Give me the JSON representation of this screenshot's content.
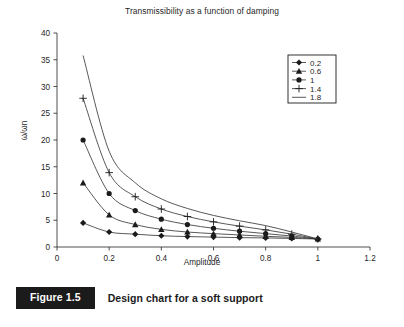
{
  "figure": {
    "caption_badge": "Figure 1.5",
    "caption_text": "Design chart for a soft support"
  },
  "chart_data": {
    "type": "line",
    "title": "Transmissibility as a function of damping",
    "xlabel": "Amplitude",
    "ylabel": "ω/ωn",
    "xlim": [
      0,
      1.2
    ],
    "ylim": [
      0,
      40
    ],
    "xticks": [
      0,
      0.2,
      0.4,
      0.6,
      0.8,
      1,
      1.2
    ],
    "xtick_labels": [
      "0",
      "0.2",
      "0.4",
      "0.6",
      "0.8",
      "1",
      "1.2"
    ],
    "yticks": [
      0,
      5,
      10,
      15,
      20,
      25,
      30,
      35,
      40
    ],
    "ytick_labels": [
      "0",
      "5",
      "10",
      "15",
      "20",
      "25",
      "30",
      "35",
      "40"
    ],
    "grid": false,
    "legend_position": "upper right",
    "legend_title": "",
    "x": [
      0.1,
      0.2,
      0.3,
      0.4,
      0.5,
      0.6,
      0.7,
      0.8,
      0.9,
      1.0
    ],
    "series": [
      {
        "name": "0.2",
        "marker": "diamond",
        "values": [
          4.5,
          2.8,
          2.4,
          2.1,
          1.95,
          1.85,
          1.75,
          1.7,
          1.6,
          1.5
        ]
      },
      {
        "name": "0.6",
        "marker": "triangle",
        "values": [
          12.0,
          6.0,
          4.2,
          3.3,
          2.8,
          2.5,
          2.25,
          2.0,
          1.8,
          1.5
        ]
      },
      {
        "name": "1",
        "marker": "circle",
        "values": [
          20.0,
          10.0,
          6.8,
          5.2,
          4.2,
          3.5,
          2.95,
          2.5,
          2.05,
          1.5
        ]
      },
      {
        "name": "1.4",
        "marker": "plus",
        "values": [
          27.8,
          13.9,
          9.4,
          7.1,
          5.7,
          4.7,
          3.9,
          3.2,
          2.4,
          1.5
        ]
      },
      {
        "name": "1.8",
        "marker": "none",
        "values": [
          35.8,
          17.9,
          12.0,
          9.0,
          7.2,
          5.9,
          4.9,
          4.0,
          2.8,
          1.5
        ]
      }
    ]
  }
}
